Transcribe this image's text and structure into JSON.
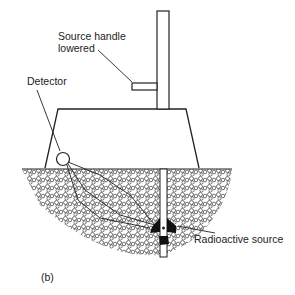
{
  "diagram": {
    "labels": {
      "source_handle": [
        "Source handle",
        "lowered"
      ],
      "detector": "Detector",
      "radioactive_source": "Radioactive source",
      "panel": "(b)"
    },
    "colors": {
      "ink": "#222222",
      "background": "#ffffff"
    }
  }
}
